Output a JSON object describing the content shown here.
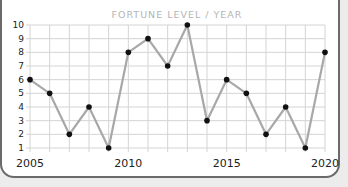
{
  "chart_data": {
    "type": "line",
    "title": "FORTUNE LEVEL / YEAR",
    "xlabel": "",
    "ylabel": "",
    "x": [
      2005,
      2006,
      2007,
      2008,
      2009,
      2010,
      2011,
      2012,
      2013,
      2014,
      2015,
      2016,
      2017,
      2018,
      2019,
      2020
    ],
    "series": [
      {
        "name": "Fortune Level",
        "values": [
          6,
          5,
          2,
          4,
          1,
          8,
          9,
          7,
          10,
          3,
          6,
          5,
          2,
          4,
          1,
          8
        ]
      }
    ],
    "xlim": [
      2005,
      2020
    ],
    "ylim": [
      1,
      10
    ],
    "x_tick_labels": [
      "2005",
      "2010",
      "2015",
      "2020"
    ],
    "y_tick_labels": [
      "1",
      "2",
      "3",
      "4",
      "5",
      "6",
      "7",
      "8",
      "9",
      "10"
    ],
    "grid": true,
    "legend": "none",
    "colors": {
      "line": "#a8a8a8",
      "marker": "#111111",
      "grid": "#d4d4d4",
      "title": "#b4b4b4"
    }
  }
}
